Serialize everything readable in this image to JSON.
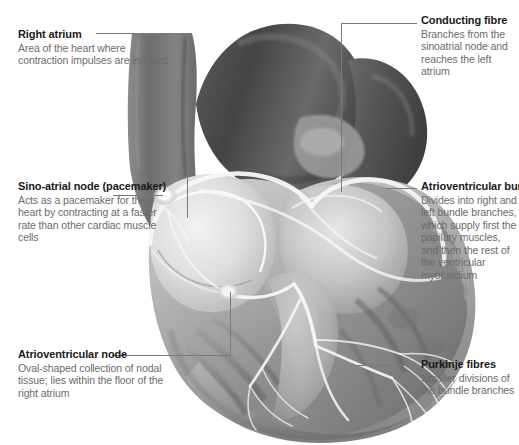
{
  "figure": {
    "style": "grayscale-anatomical-illustration",
    "width": 519,
    "height": 445,
    "background": "#ffffff",
    "title_color": "#1a1a1a",
    "body_color": "#6b6b6b",
    "leader_color": "#7a7a7a"
  },
  "callouts": [
    {
      "id": "right-atrium",
      "title": "Right atrium",
      "body": "Area of the heart where contraction impulses are initiated",
      "side": "left"
    },
    {
      "id": "sino-atrial-node",
      "title": "Sino-atrial node (pacemaker)",
      "body": "Acts as a pacemaker for the heart by contracting at a faster rate than other cardiac muscle cells",
      "side": "left"
    },
    {
      "id": "atrioventricular-node",
      "title": "Atrioventricular node",
      "body": "Oval-shaped collection of nodal tissue; lies within the floor of the right atrium",
      "side": "left"
    },
    {
      "id": "conducting-fibre",
      "title": "Conducting fibre",
      "body": "Branches from the sinoatrial node and reaches the left atrium",
      "side": "right"
    },
    {
      "id": "atrioventricular-bundle",
      "title": "Atrioventricular bundle",
      "body": "Divides into right and left bundle branches, which supply first the papilary muscles, and then the rest of the ventricular myocardium",
      "side": "right"
    },
    {
      "id": "purkinje-fibres",
      "title": "Purkinje fibres",
      "body": "Smaller divisions of the bundle branches",
      "side": "right"
    }
  ]
}
